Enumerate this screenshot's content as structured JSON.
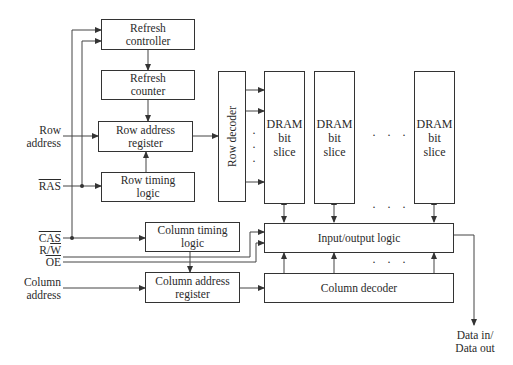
{
  "diagram": {
    "blocks": {
      "refresh_controller": [
        "Refresh",
        "controller"
      ],
      "refresh_counter": [
        "Refresh",
        "counter"
      ],
      "row_address_register": [
        "Row address",
        "register"
      ],
      "row_timing_logic": [
        "Row timing",
        "logic"
      ],
      "row_decoder": "Row decoder",
      "dram_slice": [
        "DRAM",
        "bit",
        "slice"
      ],
      "column_timing_logic": [
        "Column timing",
        "logic"
      ],
      "column_address_register": [
        "Column address",
        "register"
      ],
      "io_logic": "Input/output logic",
      "column_decoder": "Column decoder"
    },
    "inputs": {
      "row_address": [
        "Row",
        "address"
      ],
      "ras": "RAS",
      "cas": "CAS",
      "rw_r": "R/",
      "rw_w": "W",
      "oe": "OE",
      "column_address": [
        "Column",
        "address"
      ]
    },
    "outputs": {
      "data": [
        "Data in/",
        "Data out"
      ]
    },
    "ellipsis": "· · ·",
    "ellipsis_vertical": [
      "·",
      "·",
      "·"
    ]
  }
}
